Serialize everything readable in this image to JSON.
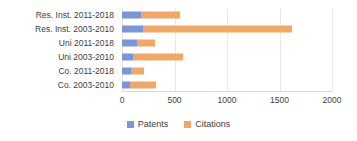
{
  "chart_data": {
    "type": "bar",
    "orientation": "horizontal",
    "stacked": true,
    "title": "",
    "xlabel": "",
    "ylabel": "",
    "xlim": [
      0,
      2000
    ],
    "grid": true,
    "gridlines_at": [
      0,
      500,
      1000,
      1500,
      2000
    ],
    "legend_position": "bottom",
    "categories": [
      "Res. Inst. 2011-2018",
      "Res. Inst. 2003-2010",
      "Uni 2011-2018",
      "Uni 2003-2010",
      "Co. 2011-2018",
      "Co. 2003-2010"
    ],
    "series": [
      {
        "name": "Patents",
        "color": "#7c95d4",
        "values": [
          180,
          200,
          140,
          105,
          85,
          80
        ]
      },
      {
        "name": "Citations",
        "color": "#f0a868",
        "values": [
          370,
          1420,
          170,
          475,
          125,
          240
        ]
      }
    ],
    "x_tick_labels": [
      "0",
      "500",
      "1000",
      "1500",
      "2000"
    ],
    "x_tick_values": [
      0,
      500,
      1000,
      1500,
      2000
    ]
  },
  "legend": {
    "items": [
      {
        "label": "Patents",
        "color": "#7c95d4"
      },
      {
        "label": "Citations",
        "color": "#f0a868"
      }
    ]
  },
  "colors": {
    "patents": "#7c95d4",
    "citations": "#f0a868",
    "grid": "#e8e8e8",
    "text": "#404040",
    "background": "#ffffff"
  }
}
